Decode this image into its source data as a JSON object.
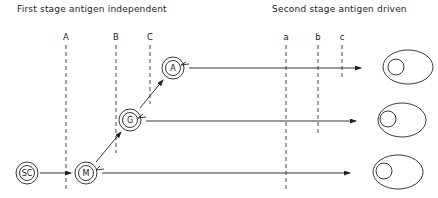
{
  "titles": {
    "first_stage": "First stage antigen independent",
    "second_stage": "Second stage antigen driven"
  },
  "markers_first_stage": [
    {
      "label": "A",
      "x": 66
    },
    {
      "label": "B",
      "x": 116
    },
    {
      "label": "C",
      "x": 150
    }
  ],
  "markers_second_stage": [
    {
      "label": "a",
      "x": 286
    },
    {
      "label": "b",
      "x": 318
    },
    {
      "label": "c",
      "x": 342
    }
  ],
  "cells": {
    "sc": {
      "label": "SC",
      "x": 27,
      "y": 173
    },
    "m": {
      "label": "M",
      "x": 86,
      "y": 173
    },
    "g": {
      "label": "G",
      "x": 130,
      "y": 120
    },
    "a": {
      "label": "A",
      "x": 173,
      "y": 68
    }
  },
  "target_cells": [
    {
      "name": "target-cell-top",
      "x": 408,
      "y": 67
    },
    {
      "name": "target-cell-middle",
      "x": 402,
      "y": 120
    },
    {
      "name": "target-cell-bottom",
      "x": 398,
      "y": 172
    }
  ],
  "colors": {
    "line": "#222222",
    "background": "#ffffff"
  }
}
